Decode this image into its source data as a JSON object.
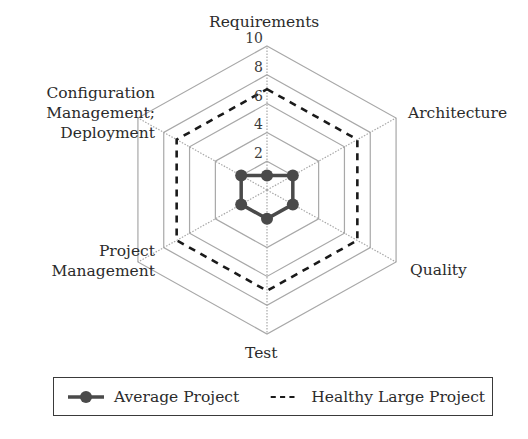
{
  "chart_data": {
    "type": "radar",
    "title": "",
    "axes": [
      "Requirements",
      "Architecture",
      "Quality",
      "Test",
      "Project Management",
      "Configuration Management; Deployment"
    ],
    "axis_label_lines": [
      [
        "Requirements"
      ],
      [
        "Architecture"
      ],
      [
        "Quality"
      ],
      [
        "Test"
      ],
      [
        "Project",
        "Management"
      ],
      [
        "Configuration",
        "Management;",
        "Deployment"
      ]
    ],
    "rlim": [
      0,
      10
    ],
    "ticks": [
      "2",
      "4",
      "6",
      "8",
      "10"
    ],
    "tick_values": [
      2,
      4,
      6,
      8,
      10
    ],
    "grid": true,
    "series": [
      {
        "name": "Average Project",
        "values": [
          1,
          2,
          2,
          2,
          2,
          2
        ],
        "style": "solid-with-markers",
        "color": "#4a4a4a"
      },
      {
        "name": "Healthy Large Project",
        "values": [
          7,
          7,
          7,
          7,
          7,
          7
        ],
        "style": "dashed",
        "color": "#1a1a1a"
      }
    ],
    "legend_position": "bottom"
  },
  "colors": {
    "grid": "#a8a8a8",
    "avg": "#4a4a4a",
    "healthy": "#1a1a1a"
  },
  "legend": {
    "average": "Average Project",
    "healthy": "Healthy Large Project"
  }
}
